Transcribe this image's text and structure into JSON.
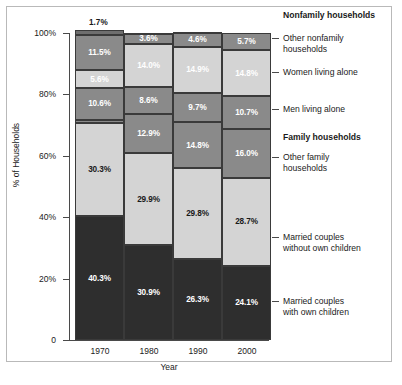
{
  "chart_data": {
    "type": "bar",
    "title": "",
    "xlabel": "Year",
    "ylabel": "% of Households",
    "categories": [
      "1970",
      "1980",
      "1990",
      "2000"
    ],
    "ylim": [
      0,
      100
    ],
    "ytick_labels": [
      "0",
      "20%",
      "40%",
      "60%",
      "80%",
      "100%"
    ],
    "ytick_values": [
      0,
      20,
      40,
      60,
      80,
      100
    ],
    "grid": false,
    "stacked": true,
    "legend_position": "right",
    "series": [
      {
        "name": "Married couples with own children",
        "group": "Family households",
        "color": "#2e2e2e",
        "text_color": "#ffffff",
        "values": [
          40.3,
          30.9,
          26.3,
          24.1
        ],
        "labels": [
          "40.3%",
          "30.9%",
          "26.3%",
          "24.1%"
        ]
      },
      {
        "name": "Married couples without own children",
        "group": "Family households",
        "color": "#d4d4d4",
        "text_color": "#1a1a1a",
        "values": [
          30.3,
          29.9,
          29.8,
          28.7
        ],
        "labels": [
          "30.3%",
          "29.9%",
          "29.8%",
          "28.7%"
        ]
      },
      {
        "name": "Other family households",
        "group": "Family households",
        "color": "#8a8a8a",
        "text_color": "#ffffff",
        "values": [
          1.0,
          12.9,
          14.8,
          16.0
        ],
        "labels": [
          "",
          "12.9%",
          "14.8%",
          "16.0%"
        ]
      },
      {
        "name": "Men living alone",
        "group": "Nonfamily households",
        "color": "#8a8a8a",
        "text_color": "#ffffff",
        "values": [
          10.6,
          8.6,
          9.7,
          10.7
        ],
        "labels": [
          "10.6%",
          "8.6%",
          "9.7%",
          "10.7%"
        ]
      },
      {
        "name": "Women living alone",
        "group": "Nonfamily households",
        "color": "#d4d4d4",
        "text_color": "#ffffff",
        "values": [
          5.6,
          14.0,
          14.9,
          14.8
        ],
        "labels": [
          "5.6%",
          "14.0%",
          "14.9%",
          "14.8%"
        ]
      },
      {
        "name": "Other nonfamily households",
        "group": "Nonfamily households",
        "color": "#8a8a8a",
        "text_color": "#ffffff",
        "values": [
          11.5,
          3.6,
          4.6,
          5.7
        ],
        "labels": [
          "11.5%",
          "3.6%",
          "4.6%",
          "5.7%"
        ]
      },
      {
        "name": "top-cap",
        "group": "Nonfamily households",
        "color": "#6e6e6e",
        "text_color": "#1a1a1a",
        "values": [
          1.7,
          0.1,
          0.1,
          0.0
        ],
        "labels": [
          "",
          "",
          "",
          ""
        ]
      }
    ],
    "outside_labels": [
      {
        "text": "1.7%",
        "category": "1970"
      }
    ],
    "annotations": []
  },
  "legend": {
    "entries": [
      {
        "label": "Nonfamily households",
        "bold": true,
        "dash": false,
        "top": 10,
        "lines": 1
      },
      {
        "label": "Other nonfamily\nhouseholds",
        "bold": false,
        "dash": true,
        "top": 33,
        "lines": 2
      },
      {
        "label": "Women living alone",
        "bold": false,
        "dash": true,
        "top": 67,
        "lines": 1
      },
      {
        "label": "Men living alone",
        "bold": false,
        "dash": true,
        "top": 104,
        "lines": 1
      },
      {
        "label": "Family households",
        "bold": true,
        "dash": false,
        "top": 132,
        "lines": 1
      },
      {
        "label": "Other family\nhouseholds",
        "bold": false,
        "dash": true,
        "top": 152,
        "lines": 2
      },
      {
        "label": "Married couples\nwithout own children",
        "bold": false,
        "dash": true,
        "top": 232,
        "lines": 2
      },
      {
        "label": "Married couples\nwith own children",
        "bold": false,
        "dash": true,
        "top": 296,
        "lines": 2
      }
    ]
  }
}
